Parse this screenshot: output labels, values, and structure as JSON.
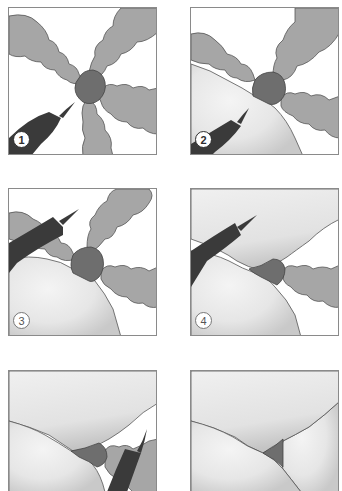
{
  "figure": {
    "type": "step-sequence illustration",
    "colors": {
      "lobe_gray": "#a6a6a6",
      "junction_dark": "#6e6e6e",
      "probe_dark": "#3a3a3a",
      "fused_light": "#ececec",
      "outline": "#555555",
      "border": "#8a8a8a"
    },
    "panels": [
      {
        "id": 1,
        "label": "1",
        "probe": true,
        "fused_lobes": 0
      },
      {
        "id": 2,
        "label": "2",
        "probe": true,
        "fused_lobes": 1
      },
      {
        "id": 3,
        "label": "3",
        "probe": true,
        "fused_lobes": 1
      },
      {
        "id": 4,
        "label": "4",
        "probe": true,
        "fused_lobes": 2
      },
      {
        "id": 5,
        "label": "",
        "probe": true,
        "fused_lobes": 3
      },
      {
        "id": 6,
        "label": "",
        "probe": false,
        "fused_lobes": 4
      }
    ]
  }
}
